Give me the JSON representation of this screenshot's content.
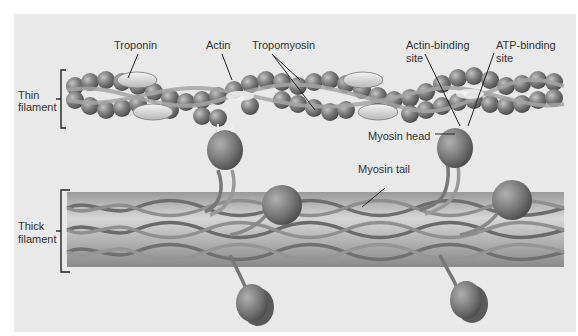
{
  "figure": {
    "labels": {
      "troponin": "Troponin",
      "actin": "Actin",
      "tropomyosin": "Tropomyosin",
      "actin_binding_site_1": "Actin-binding",
      "actin_binding_site_2": "site",
      "atp_binding_site_1": "ATP-binding",
      "atp_binding_site_2": "site",
      "myosin_head": "Myosin head",
      "myosin_tail": "Myosin tail",
      "thin_filament_1": "Thin",
      "thin_filament_2": "filament",
      "thick_filament_1": "Thick",
      "thick_filament_2": "filament"
    },
    "colors": {
      "background": "#e9e9e9",
      "actin_bead": "#7a7a7a",
      "troponin": "#d8d8d8",
      "tropomyosin": "#9a9a9a",
      "thick_core": "#a8a8a8",
      "myosin_strand": "#6e6e6e",
      "label_text": "#333333"
    }
  }
}
